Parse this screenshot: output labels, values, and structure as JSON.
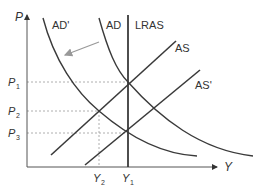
{
  "diagram": {
    "type": "AD-AS macroeconomic diagram",
    "axes": {
      "y_label": "P",
      "x_label": "Y"
    },
    "curves": {
      "ad": "AD",
      "ad_prime": "AD'",
      "lras": "LRAS",
      "as": "AS",
      "as_prime": "AS'"
    },
    "price_levels": {
      "p1": "P",
      "p1_sub": "1",
      "p2": "P",
      "p2_sub": "2",
      "p3": "P",
      "p3_sub": "3"
    },
    "output_levels": {
      "y2": "Y",
      "y2_sub": "2",
      "y1": "Y",
      "y1_sub": "1"
    },
    "annotations": {
      "shift_arrow": "AD shifts left to AD'"
    },
    "colors": {
      "curve": "#3a3a3a",
      "axis": "#555555",
      "dashed": "#888888",
      "arrow": "#888888"
    }
  }
}
